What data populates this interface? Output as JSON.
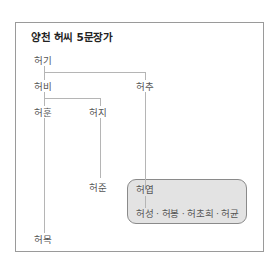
{
  "title": "양천 허씨 5문장가",
  "nodes": {
    "heogi": "허기",
    "heobi": "허비",
    "heochu": "허추",
    "heohun": "허훈",
    "heoji": "허지",
    "heojun": "허준",
    "heoyeop": "허엽",
    "heoyeop_children": "허성 · 허봉 · 허초희 · 허균",
    "heomok": "허목"
  },
  "highlight_group": [
    "허엽",
    "허성",
    "허봉",
    "허초희",
    "허균"
  ],
  "colors": {
    "line": "#b5b5b5",
    "box_fill": "#e3e3e3",
    "box_border": "#8a8a8a",
    "text": "#555555",
    "title": "#222222"
  }
}
